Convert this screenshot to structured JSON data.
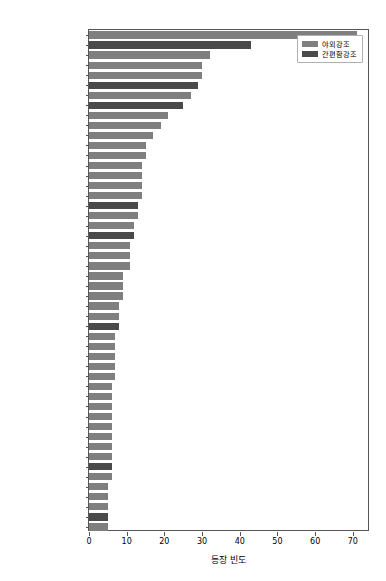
{
  "chart_data": {
    "type": "bar",
    "orientation": "horizontal",
    "title": "",
    "xlabel": "등장 빈도",
    "ylabel": "",
    "xlim": [
      0,
      74.55
    ],
    "xticks": [
      0,
      10,
      20,
      30,
      40,
      50,
      60,
      70
    ],
    "xticklabels": [
      "0",
      "10",
      "20",
      "30",
      "40",
      "50",
      "60",
      "70"
    ],
    "grid": false,
    "legend_position": "upper right",
    "series": [
      {
        "name": "야외강조",
        "color": "#7f7f7f"
      },
      {
        "name": "간편함강조",
        "color": "#4a4a4a"
      }
    ],
    "categories": [
      "#떡볶이맛집",
      "#캠핑밀키트",
      "#정성가득",
      "#궁중떡볶이",
      "#간장떡볶이",
      "#까르보나라떡볶이",
      "#떡볶이양념분말",
      "#반조리식품",
      "#박막례시피",
      "#오늘출발",
      "#맛있는떡",
      "#떡볶이양념장",
      "#맛있는간식",
      "#반조리음식",
      "#요미네떡볶이",
      "#요미녀",
      "#간단식사",
      "#술안주",
      "#간편식",
      "#가래떡",
      "#간편요리",
      "#먹기편한",
      "#생일음식",
      "#홈파티",
      "#캠핑음식",
      "#간단요리",
      "#집들이",
      "#치즈떡볶이",
      "#떡볶이밀키트",
      "#홈캉스",
      "#로제떡볶이",
      "#집에서즐기는",
      "#안전한먹거리",
      "#아이간식",
      "#짜장떡볶이",
      "#쌀떡볶이",
      "#집들이음식",
      "#분식",
      "#홈파티음식",
      "#밀떡",
      "#떡볶이양념",
      "#매운떡볶이",
      "#떡볶이떡",
      "#캠핑요리",
      "#밀떡볶이",
      "#즉석떡볶이",
      "#떡볶이소스",
      "#국물떡볶이",
      "#밀키트",
      "#떡볶이"
    ],
    "values": [
      5,
      5,
      5,
      5,
      5,
      6,
      6,
      6,
      6,
      6,
      6,
      6,
      6,
      6,
      6,
      7,
      7,
      7,
      7,
      7,
      8,
      8,
      8,
      9,
      9,
      9,
      11,
      11,
      11,
      12,
      12,
      13,
      13,
      14,
      14,
      14,
      14,
      15,
      15,
      17,
      19,
      21,
      25,
      27,
      29,
      30,
      30,
      32,
      43,
      71
    ],
    "series_index": [
      0,
      1,
      0,
      0,
      0,
      0,
      1,
      0,
      0,
      0,
      0,
      0,
      0,
      0,
      0,
      0,
      0,
      0,
      0,
      0,
      1,
      0,
      0,
      0,
      0,
      0,
      0,
      0,
      0,
      1,
      0,
      0,
      1,
      0,
      0,
      0,
      0,
      0,
      0,
      0,
      0,
      0,
      1,
      0,
      1,
      0,
      0,
      0,
      1,
      0
    ]
  },
  "legend": {
    "items": [
      {
        "label": "야외강조"
      },
      {
        "label": "간편함강조"
      }
    ]
  },
  "axis": {
    "xlabel": "등장 빈도"
  }
}
